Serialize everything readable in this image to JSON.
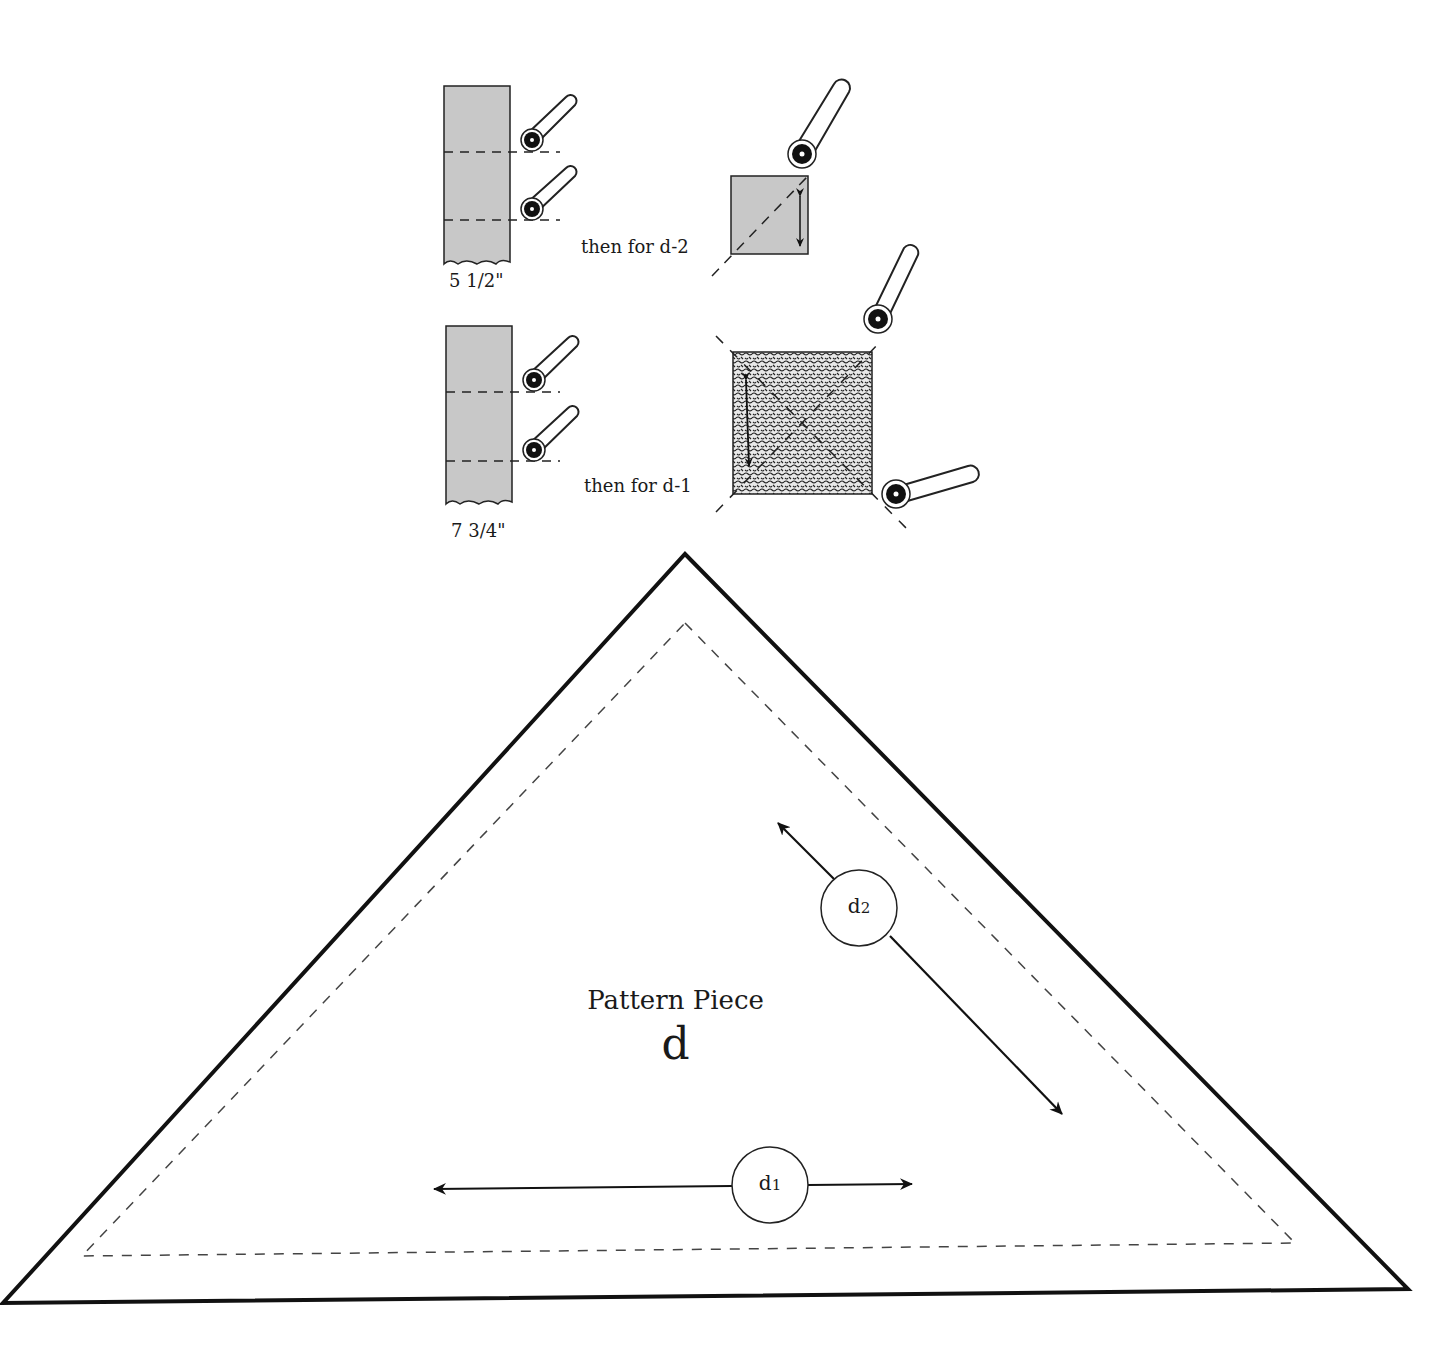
{
  "diagram": {
    "title": "Pattern Piece",
    "piece_letter": "d",
    "steps": [
      {
        "strip_width_label": "5 1/2\"",
        "then_label": "then for d-2"
      },
      {
        "strip_width_label": "7 3/4\"",
        "then_label": "then for d-1"
      }
    ],
    "grainlines": [
      {
        "label_main": "d",
        "label_sub": "2",
        "orientation": "diagonal"
      },
      {
        "label_main": "d",
        "label_sub": "1",
        "orientation": "horizontal"
      }
    ],
    "colors": {
      "outline": "#111111",
      "fabric_gray": "#c8c8c8",
      "dashed": "#444444"
    }
  }
}
